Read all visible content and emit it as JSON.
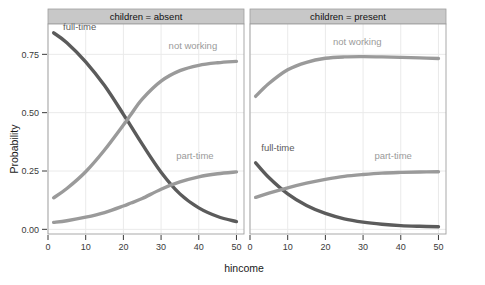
{
  "chart_data": {
    "type": "line",
    "title": "",
    "xlabel": "hincome",
    "ylabel": "Probability",
    "xlim": [
      0,
      52
    ],
    "ylim": [
      -0.02,
      0.88
    ],
    "xticks": [
      0,
      10,
      20,
      30,
      40,
      50
    ],
    "xtick_labels": [
      "0",
      "10",
      "20",
      "30",
      "40",
      "50"
    ],
    "yticks": [
      0.0,
      0.25,
      0.5,
      0.75
    ],
    "ytick_labels": [
      "0.00",
      "0.25",
      "0.50",
      "0.75"
    ],
    "grid": true,
    "legend_position": "inline-labels",
    "facet_variable": "children",
    "panels": [
      {
        "strip_label": "children = absent",
        "series": [
          {
            "name": "full-time",
            "label": "full-time",
            "color": "#5b5b5b",
            "label_x": 4.0,
            "label_y": 0.855,
            "x": [
              1.5,
              5,
              10,
              15,
              20,
              22,
              25,
              30,
              35,
              40,
              45,
              50
            ],
            "y": [
              0.842,
              0.8,
              0.718,
              0.616,
              0.493,
              0.442,
              0.365,
              0.245,
              0.152,
              0.092,
              0.055,
              0.033
            ]
          },
          {
            "name": "not-working",
            "label": "not working",
            "color": "#9a9a9a",
            "label_x": 32.0,
            "label_y": 0.775,
            "x": [
              1.5,
              5,
              10,
              15,
              20,
              22,
              25,
              30,
              35,
              40,
              45,
              50
            ],
            "y": [
              0.135,
              0.175,
              0.247,
              0.34,
              0.447,
              0.492,
              0.558,
              0.635,
              0.68,
              0.703,
              0.714,
              0.72
            ]
          },
          {
            "name": "part-time",
            "label": "part-time",
            "color": "#9a9a9a",
            "label_x": 34.0,
            "label_y": 0.3,
            "x": [
              1.5,
              5,
              10,
              15,
              20,
              22,
              25,
              30,
              35,
              40,
              45,
              50
            ],
            "y": [
              0.03,
              0.037,
              0.052,
              0.072,
              0.1,
              0.113,
              0.132,
              0.172,
              0.203,
              0.225,
              0.238,
              0.246
            ]
          }
        ]
      },
      {
        "strip_label": "children = present",
        "series": [
          {
            "name": "not-working",
            "label": "not working",
            "color": "#9a9a9a",
            "label_x": 22.0,
            "label_y": 0.79,
            "x": [
              1.5,
              5,
              10,
              15,
              20,
              25,
              30,
              35,
              40,
              45,
              50
            ],
            "y": [
              0.57,
              0.625,
              0.684,
              0.716,
              0.733,
              0.739,
              0.74,
              0.739,
              0.737,
              0.735,
              0.732
            ]
          },
          {
            "name": "full-time",
            "label": "full-time",
            "color": "#5b5b5b",
            "label_x": 3.0,
            "label_y": 0.335,
            "x": [
              1.5,
              5,
              10,
              15,
              20,
              25,
              30,
              35,
              40,
              45,
              50
            ],
            "y": [
              0.285,
              0.222,
              0.152,
              0.102,
              0.068,
              0.045,
              0.031,
              0.022,
              0.016,
              0.013,
              0.011
            ]
          },
          {
            "name": "part-time",
            "label": "part-time",
            "color": "#9a9a9a",
            "label_x": 33.0,
            "label_y": 0.3,
            "x": [
              1.5,
              5,
              10,
              15,
              20,
              25,
              30,
              35,
              40,
              45,
              50
            ],
            "y": [
              0.137,
              0.155,
              0.178,
              0.198,
              0.214,
              0.227,
              0.235,
              0.241,
              0.244,
              0.246,
              0.247
            ]
          }
        ]
      }
    ],
    "colors": {
      "dark_series": "#5b5b5b",
      "light_series": "#9a9a9a",
      "strip_background": "#c8c8c8",
      "panel_background": "#ffffff",
      "grid_line": "#eaeaea",
      "border": "#9f9f9f",
      "axis_text": "#3a3a3a"
    }
  }
}
